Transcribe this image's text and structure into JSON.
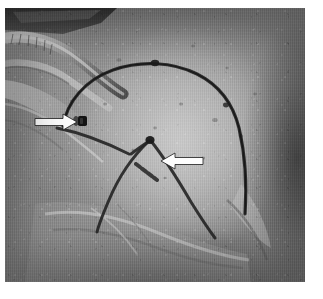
{
  "figure": {
    "domain": "Natural-Image",
    "kind": "clinical-intraoperative-photograph",
    "color_mode": "grayscale",
    "caption": "",
    "width_px": 323,
    "height_px": 299,
    "border": {
      "background": "#ffffff",
      "left_px": 5,
      "top_px": 8,
      "right_px": 18,
      "bottom_px": 17
    }
  },
  "palette": {
    "page_background": "#ffffff",
    "photo_mid_gray": "#a6a6a6",
    "photo_light_gray": "#c8c8c8",
    "photo_dark_gray": "#4a4a4a",
    "photo_shadow": "#2b2b2b",
    "marking_ink": "#232323",
    "annotation_arrow": "#fdfdfd",
    "annotation_arrow_outline": "#1a1a1a"
  },
  "scene": {
    "subject_label": "draped breast / chest wall",
    "regions": [
      {
        "name": "surgical-drape-upper-left",
        "description": "folded translucent drape and tubing, bright highlights"
      },
      {
        "name": "breast-mound",
        "description": "central convex soft-tissue mound, evenly lit"
      },
      {
        "name": "shadow-right",
        "description": "dark falloff along right margin"
      },
      {
        "name": "drape-fold-lower",
        "description": "drape folds crossing the lower third"
      }
    ],
    "texture": "fine vertical scan/weave striping across the whole frame"
  },
  "markings": [
    {
      "id": "outline-arc",
      "name": "breast-outline-marking",
      "description": "large inked arc outlining the superior and lateral border of the breast mound",
      "ink": "#232323"
    },
    {
      "id": "wise-pattern-v",
      "name": "inverted-v-marking",
      "description": "inverted-V (wise-pattern) limbs converging at a central apex",
      "ink": "#232323"
    },
    {
      "id": "apex-dot",
      "name": "apex-dot-marking",
      "description": "dark dot at the convergence point of the inverted-V limbs",
      "ink": "#1c1c1c"
    },
    {
      "id": "superior-dot",
      "name": "superior-dot-marking",
      "description": "dark dot at the crest of the outline arc",
      "ink": "#1c1c1c"
    },
    {
      "id": "dash-mark",
      "name": "dash-marking",
      "description": "short oblique dashed line inside the inverted-V, indicated by the right arrow",
      "ink": "#2a2a2a"
    },
    {
      "id": "medial-line",
      "name": "medial-marking-line",
      "description": "oblique line running from the left toward the apex",
      "ink": "#232323"
    }
  ],
  "annotations": {
    "arrows": [
      {
        "id": "arrow-left",
        "name": "annotation-arrow-left",
        "direction": "points-right",
        "tip_x": 79,
        "tip_y": 122,
        "tail_x": 35,
        "tail_y": 122,
        "points_to": "marker-clip",
        "color": "#fdfdfd"
      },
      {
        "id": "arrow-right",
        "name": "annotation-arrow-right",
        "direction": "points-left",
        "tip_x": 168,
        "tip_y": 174,
        "tail_x": 205,
        "tail_y": 174,
        "points_to": "dash-marking",
        "color": "#fdfdfd"
      }
    ],
    "marker_clip": {
      "id": "marker-clip",
      "name": "marker-clip",
      "description": "small dark radiopaque marker / clip on the skin at the left field, target of the left arrow",
      "x": 84,
      "y": 121,
      "ink": "#141414"
    }
  }
}
